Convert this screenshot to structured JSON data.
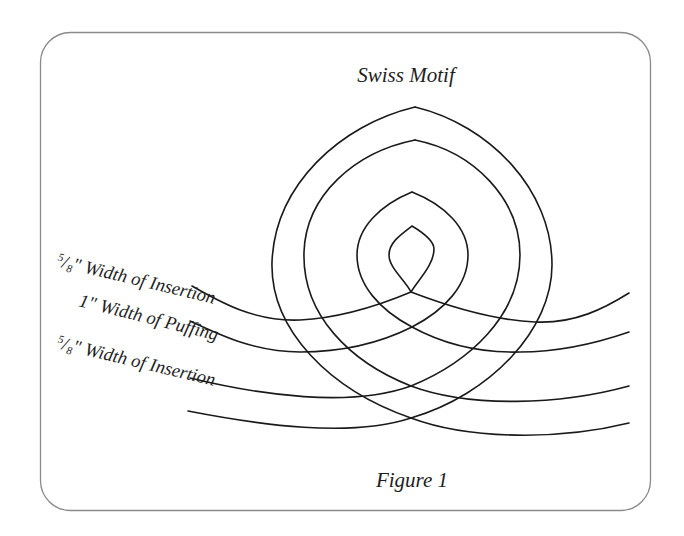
{
  "figure": {
    "title": "Swiss Motif",
    "caption": "Figure 1",
    "labels": [
      {
        "fraction_numerator": "5",
        "fraction_denominator": "8",
        "measure": "\"",
        "text": " Width of Insertion"
      },
      {
        "fraction_numerator": "",
        "fraction_denominator": "",
        "measure": "1\"",
        "text": " Width of Puffing"
      },
      {
        "fraction_numerator": "5",
        "fraction_denominator": "8",
        "measure": "\"",
        "text": " Width of Insertion"
      }
    ],
    "colors": {
      "line": "#1a1a1a",
      "frame": "#8a8a8a",
      "background": "#ffffff"
    }
  }
}
